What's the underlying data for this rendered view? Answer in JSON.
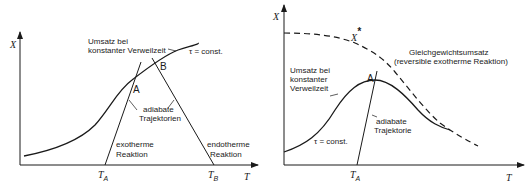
{
  "left_diagram": {
    "y_axis_label": "X",
    "x_axis_label": "T",
    "curve_label_line1": "Umsatz bei",
    "curve_label_line2": "konstanter  Verweilzeit",
    "tau_label": "τ = const.",
    "point_a": "A",
    "point_b": "B",
    "trajectories_line1": "adiabate",
    "trajectories_line2": "Trajektorien",
    "exo_line1": "exotherme",
    "exo_line2": "Reaktion",
    "endo_line1": "endotherme",
    "endo_line2": "Reaktion",
    "tick_ta_main": "T",
    "tick_ta_sub": "A",
    "tick_tb_main": "T",
    "tick_tb_sub": "B"
  },
  "right_diagram": {
    "y_axis_label": "X",
    "x_axis_label": "T",
    "equilibrium_symbol": "X",
    "equilibrium_star": "*",
    "equilibrium_line1": "Gleichgewichtsumsatz",
    "equilibrium_line2": "(reversible  exotherme  Reaktion)",
    "curve_label_line1": "Umsatz bei",
    "curve_label_line2": "konstanter",
    "curve_label_line3": "Verweilzeit",
    "tau_label": "τ = const.",
    "point_a": "A",
    "trajectory_line1": "adiabate",
    "trajectory_line2": "Trajektorie",
    "tick_ta_main": "T",
    "tick_ta_sub": "A"
  }
}
